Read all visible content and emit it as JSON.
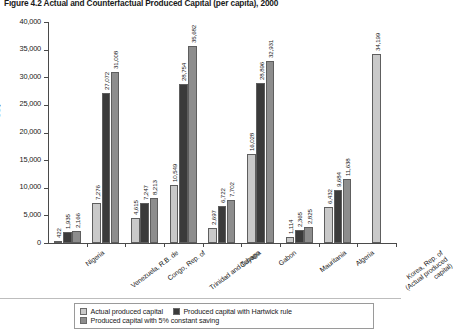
{
  "figure": {
    "title": "Figure 4.2  Actual and Counterfactual Produced Capital (per capita), 2000"
  },
  "colors": {
    "actual": "#c9c9c9",
    "hartwick": "#3b3b3b",
    "constant_saving": "#8d8d8d",
    "axis": "#4a4a4a",
    "text": "#1a1a1a"
  },
  "chart_data": {
    "type": "bar",
    "title": "Figure 4.2  Actual and Counterfactual Produced Capital (per capita), 2000",
    "xlabel": "",
    "ylabel": "US$",
    "ylim": [
      0,
      40000
    ],
    "ytick_labels": [
      "0",
      "5,000",
      "10,000",
      "15,000",
      "20,000",
      "25,000",
      "30,000",
      "35,000",
      "40,000"
    ],
    "ytick_values": [
      0,
      5000,
      10000,
      15000,
      20000,
      25000,
      30000,
      35000,
      40000
    ],
    "grid": false,
    "legend_position": "bottom",
    "categories": [
      "Nigeria",
      "Venezuela, R.B. de",
      "Congo, Rep. of",
      "Trinidad and Tobago",
      "Guyana",
      "Gabon",
      "Mauritania",
      "Algeria",
      "Korea, Rep. of\n(Actual produced\ncapital)"
    ],
    "category_labels": [
      [
        "Nigeria"
      ],
      [
        "Venezuela, R.B. de"
      ],
      [
        "Congo, Rep. of"
      ],
      [
        "Trinidad and Tobago"
      ],
      [
        "Guyana"
      ],
      [
        "Gabon"
      ],
      [
        "Mauritania"
      ],
      [
        "Algeria"
      ],
      [
        "Korea, Rep. of",
        "(Actual produced",
        "capital)"
      ]
    ],
    "series": [
      {
        "name": "Actual produced capital",
        "color": "#c9c9c9",
        "values": [
          422,
          7276,
          4615,
          10549,
          2697,
          16028,
          1114,
          6432,
          34199
        ],
        "labels": [
          "422",
          "7,276",
          "4,615",
          "10,549",
          "2,697",
          "16,028",
          "1,114",
          "6,432",
          "34,199"
        ]
      },
      {
        "name": "Produced capital with Hartwick rule",
        "color": "#3b3b3b",
        "values": [
          1935,
          27072,
          7247,
          28754,
          6722,
          28896,
          2365,
          9684,
          null
        ],
        "labels": [
          "1,935",
          "27,072",
          "7,247",
          "28,754",
          "6,722",
          "28,896",
          "2,365",
          "9,684",
          null
        ]
      },
      {
        "name": "Produced capital with 5% constant saving",
        "color": "#8d8d8d",
        "values": [
          2166,
          31008,
          8213,
          35682,
          7702,
          32931,
          2825,
          11638,
          null
        ],
        "labels": [
          "2,166",
          "31,008",
          "8,213",
          "35,682",
          "7,702",
          "32,931",
          "2,825",
          "11,638",
          null
        ]
      }
    ]
  },
  "legend": {
    "items": [
      {
        "label": "Actual produced capital",
        "color": "#c9c9c9"
      },
      {
        "label": "Produced capital with Hartwick rule",
        "color": "#3b3b3b"
      },
      {
        "label": "Produced capital with 5% constant saving",
        "color": "#8d8d8d"
      }
    ]
  }
}
